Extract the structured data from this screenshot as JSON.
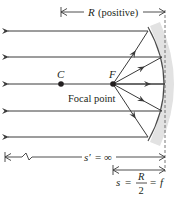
{
  "diagram": {
    "type": "optics-ray-diagram",
    "labels": {
      "radius": "R",
      "radius_note": "(positive)",
      "center": "C",
      "focus": "F",
      "focal_point": "Focal point",
      "image_distance_symbol": "s′",
      "image_distance_value": "= ∞",
      "object_distance_symbol": "s",
      "eq1": "=",
      "frac_num": "R",
      "frac_den": "2",
      "eq2": "=",
      "focal_symbol": "f"
    },
    "colors": {
      "ray": "#3a3a3a",
      "mirror": "#4a4a4a",
      "mirror_shade": "#d8d8d8",
      "text": "#231f20",
      "dashed": "#555555"
    },
    "rays_count": 5
  }
}
